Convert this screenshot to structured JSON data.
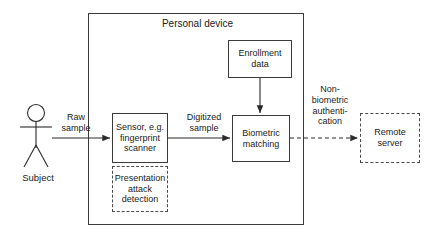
{
  "diagram": {
    "container": {
      "label": "Personal device"
    },
    "actor": {
      "label": "Subject",
      "icon": "stick-figure-icon"
    },
    "nodes": [
      {
        "id": "sensor",
        "label": "Sensor, e.g.\nfingerprint\nscanner",
        "style": "solid"
      },
      {
        "id": "presentation-attack-detection",
        "label": "Presentation\nattack\ndetection",
        "style": "dashed"
      },
      {
        "id": "enrollment-data",
        "label": "Enrollment\ndata",
        "style": "solid"
      },
      {
        "id": "biometric-matching",
        "label": "Biometric\nmatching",
        "style": "solid"
      },
      {
        "id": "remote-server",
        "label": "Remote\nserver",
        "style": "dashed"
      }
    ],
    "edges": [
      {
        "id": "raw-sample",
        "label": "Raw\nsample",
        "from": "subject",
        "to": "sensor",
        "style": "solid"
      },
      {
        "id": "digitized-sample",
        "label": "Digitized\nsample",
        "from": "sensor",
        "to": "biometric-matching",
        "style": "solid"
      },
      {
        "id": "enrollment-feed",
        "label": "",
        "from": "enrollment-data",
        "to": "biometric-matching",
        "style": "solid"
      },
      {
        "id": "non-biometric-authentication",
        "label": "Non-\nbiometric\nauthenti-\ncation",
        "from": "biometric-matching",
        "to": "remote-server",
        "style": "dashed"
      }
    ],
    "colors": {
      "stroke": "#3a3a3a",
      "text": "#1a1a1a",
      "background": "#ffffff"
    }
  }
}
